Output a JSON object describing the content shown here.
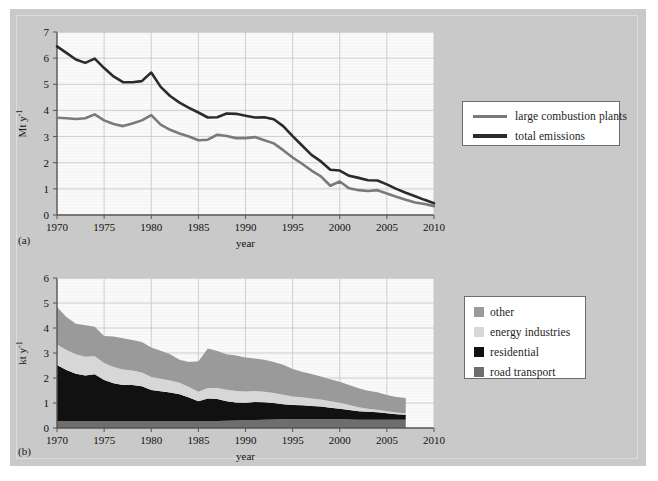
{
  "figure": {
    "background_color": "#c9c9c9",
    "panel_a_label": "(a)",
    "panel_b_label": "(b)"
  },
  "colors": {
    "total_emissions": "#2b2b2b",
    "large_combustion_plants": "#7a7a7a",
    "other": "#9a9a9a",
    "energy_industries": "#d7d7d7",
    "residential": "#111111",
    "road_transport": "#6e6e6e",
    "plot_background": "#fbfbfb",
    "grid": "#c4c4c4",
    "axis": "#555555"
  },
  "chart_data": [
    {
      "id": "panel_a",
      "type": "line",
      "title": "",
      "xlabel": "year",
      "ylabel": "Mt y-1",
      "ylabel_display": "Mt y",
      "ylabel_sup": "-1",
      "xlim": [
        1970,
        2010
      ],
      "ylim": [
        0,
        7
      ],
      "xticks": [
        1970,
        1975,
        1980,
        1985,
        1990,
        1995,
        2000,
        2005,
        2010
      ],
      "yticks": [
        0,
        1,
        2,
        3,
        4,
        5,
        6,
        7
      ],
      "grid": true,
      "legend_position": "right-outside",
      "x": [
        1970,
        1971,
        1972,
        1973,
        1974,
        1975,
        1976,
        1977,
        1978,
        1979,
        1980,
        1981,
        1982,
        1983,
        1984,
        1985,
        1986,
        1987,
        1988,
        1989,
        1990,
        1991,
        1992,
        1993,
        1994,
        1995,
        1996,
        1997,
        1998,
        1999,
        2000,
        2001,
        2002,
        2003,
        2004,
        2005,
        2006,
        2007,
        2008,
        2009,
        2010
      ],
      "series": [
        {
          "name": "total emissions",
          "color": "#2b2b2b",
          "values": [
            6.45,
            6.2,
            5.95,
            5.82,
            5.98,
            5.62,
            5.3,
            5.08,
            5.08,
            5.12,
            5.45,
            4.9,
            4.55,
            4.3,
            4.1,
            3.92,
            3.73,
            3.74,
            3.88,
            3.87,
            3.8,
            3.73,
            3.74,
            3.66,
            3.4,
            3.02,
            2.66,
            2.3,
            2.05,
            1.73,
            1.7,
            1.5,
            1.42,
            1.33,
            1.32,
            1.17,
            1.0,
            0.85,
            0.72,
            0.58,
            0.45
          ]
        },
        {
          "name": "large combustion plants",
          "color": "#7a7a7a",
          "values": [
            3.72,
            3.7,
            3.67,
            3.7,
            3.85,
            3.62,
            3.48,
            3.4,
            3.5,
            3.62,
            3.82,
            3.46,
            3.26,
            3.12,
            3.0,
            2.86,
            2.88,
            3.07,
            3.02,
            2.94,
            2.94,
            2.98,
            2.86,
            2.74,
            2.48,
            2.2,
            1.96,
            1.7,
            1.48,
            1.12,
            1.28,
            1.02,
            0.95,
            0.92,
            0.95,
            0.82,
            0.7,
            0.58,
            0.48,
            0.42,
            0.34
          ]
        }
      ],
      "legend": [
        {
          "label": "large combustion plants",
          "color": "#7a7a7a"
        },
        {
          "label": "total emissions",
          "color": "#2b2b2b"
        }
      ]
    },
    {
      "id": "panel_b",
      "type": "area",
      "title": "",
      "xlabel": "year",
      "ylabel": "kt y-1",
      "ylabel_display": "kt y",
      "ylabel_sup": "-1",
      "xlim": [
        1970,
        2010
      ],
      "ylim": [
        0,
        6
      ],
      "xticks": [
        1970,
        1975,
        1980,
        1985,
        1990,
        1995,
        2000,
        2005,
        2010
      ],
      "yticks": [
        0,
        1,
        2,
        3,
        4,
        5,
        6
      ],
      "grid": true,
      "stacked": true,
      "legend_position": "right-outside",
      "x": [
        1970,
        1971,
        1972,
        1973,
        1974,
        1975,
        1976,
        1977,
        1978,
        1979,
        1980,
        1981,
        1982,
        1983,
        1984,
        1985,
        1986,
        1987,
        1988,
        1989,
        1990,
        1991,
        1992,
        1993,
        1994,
        1995,
        1996,
        1997,
        1998,
        1999,
        2000,
        2001,
        2002,
        2003,
        2004,
        2005,
        2006,
        2007
      ],
      "series": [
        {
          "name": "road transport",
          "color": "#6e6e6e",
          "values": [
            0.27,
            0.27,
            0.27,
            0.27,
            0.27,
            0.27,
            0.27,
            0.27,
            0.27,
            0.27,
            0.27,
            0.27,
            0.27,
            0.27,
            0.27,
            0.27,
            0.28,
            0.28,
            0.29,
            0.3,
            0.31,
            0.32,
            0.33,
            0.34,
            0.35,
            0.36,
            0.36,
            0.36,
            0.36,
            0.36,
            0.35,
            0.34,
            0.33,
            0.33,
            0.33,
            0.33,
            0.33,
            0.33
          ]
        },
        {
          "name": "residential",
          "color": "#111111",
          "values": [
            2.25,
            2.05,
            1.9,
            1.83,
            1.88,
            1.65,
            1.52,
            1.45,
            1.45,
            1.4,
            1.25,
            1.2,
            1.15,
            1.08,
            0.95,
            0.8,
            0.9,
            0.88,
            0.78,
            0.72,
            0.7,
            0.72,
            0.7,
            0.66,
            0.6,
            0.56,
            0.55,
            0.52,
            0.5,
            0.45,
            0.42,
            0.38,
            0.34,
            0.32,
            0.3,
            0.26,
            0.22,
            0.2
          ]
        },
        {
          "name": "energy industries",
          "color": "#d7d7d7",
          "values": [
            0.82,
            0.8,
            0.78,
            0.75,
            0.72,
            0.68,
            0.65,
            0.62,
            0.58,
            0.55,
            0.52,
            0.5,
            0.48,
            0.46,
            0.42,
            0.38,
            0.42,
            0.44,
            0.46,
            0.46,
            0.45,
            0.44,
            0.42,
            0.4,
            0.38,
            0.34,
            0.32,
            0.3,
            0.28,
            0.26,
            0.24,
            0.2,
            0.16,
            0.12,
            0.1,
            0.08,
            0.07,
            0.06
          ]
        },
        {
          "name": "other",
          "color": "#9a9a9a",
          "values": [
            1.5,
            1.32,
            1.22,
            1.26,
            1.18,
            1.08,
            1.22,
            1.25,
            1.22,
            1.22,
            1.18,
            1.12,
            1.05,
            0.92,
            1.0,
            1.22,
            1.58,
            1.48,
            1.42,
            1.42,
            1.36,
            1.3,
            1.28,
            1.24,
            1.2,
            1.1,
            1.02,
            0.98,
            0.92,
            0.88,
            0.84,
            0.8,
            0.76,
            0.72,
            0.7,
            0.65,
            0.62,
            0.61
          ]
        }
      ],
      "legend": [
        {
          "label": "other",
          "color": "#9a9a9a"
        },
        {
          "label": "energy industries",
          "color": "#d7d7d7"
        },
        {
          "label": "residential",
          "color": "#111111"
        },
        {
          "label": "road transport",
          "color": "#6e6e6e"
        }
      ]
    }
  ]
}
